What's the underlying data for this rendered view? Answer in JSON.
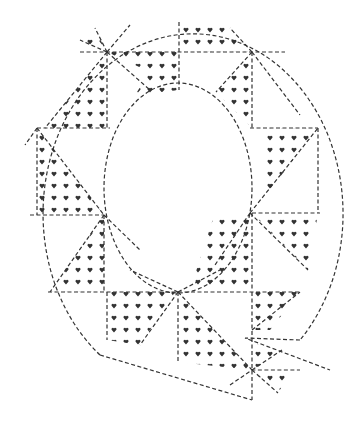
{
  "image": {
    "title": "Letter Q quilt pattern",
    "letter": "Q",
    "pattern": "heart-dotted patchwork triangles",
    "line_color": "#333333",
    "background": "#ffffff"
  },
  "shapes": {
    "outer": {
      "cx": 177,
      "cy": 200,
      "rx": 150,
      "ry": 180
    },
    "inner": {
      "cx": 178,
      "cy": 188,
      "rx": 74,
      "ry": 105
    }
  }
}
